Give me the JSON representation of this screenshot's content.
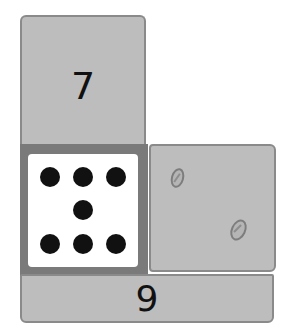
{
  "diagram": {
    "type": "number-bond-cards",
    "top_card": {
      "label": "7"
    },
    "dot_card": {
      "pattern": "dice-style",
      "dot_count": 7,
      "rows": [
        3,
        1,
        3
      ]
    },
    "counter_card": {
      "items": [
        "seed",
        "seed"
      ],
      "count": 2
    },
    "bottom_card": {
      "label": "9"
    },
    "colors": {
      "card_fill": "#bdbdbd",
      "card_border": "#8a8a8a",
      "frame": "#7a7a7a",
      "dot_card": "#ffffff",
      "dot": "#111111",
      "text": "#111111"
    }
  }
}
